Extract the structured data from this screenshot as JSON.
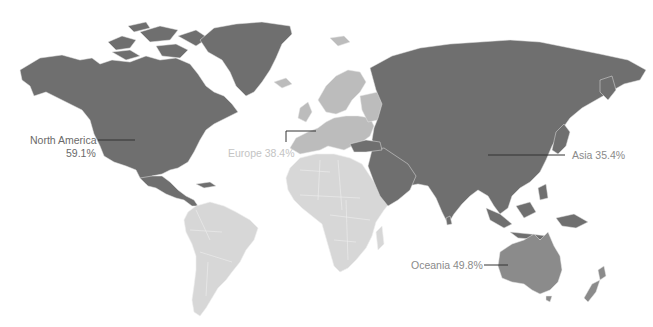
{
  "map": {
    "type": "choropleth-world",
    "colors": {
      "background": "#ffffff",
      "north_america": "#6f6f6f",
      "asia": "#6f6f6f",
      "oceania": "#8b8b8b",
      "europe": "#bcbcbc",
      "south_america": "#d7d7d7",
      "africa": "#d7d7d7",
      "border": "#ececec",
      "label_dark": "#6a6a6a",
      "label_light": "#c4c4c4",
      "leader_line": "#333333"
    },
    "regions": [
      {
        "name": "North America",
        "value": "59.1%"
      },
      {
        "name": "Europe",
        "value": "38.4%"
      },
      {
        "name": "Asia",
        "value": "35.4%"
      },
      {
        "name": "Oceania",
        "value": "49.8%"
      }
    ]
  },
  "labels": {
    "north_america_name": "North America",
    "north_america_value": "59.1%",
    "europe": "Europe 38.4%",
    "asia": "Asia 35.4%",
    "oceania": "Oceania 49.8%"
  }
}
